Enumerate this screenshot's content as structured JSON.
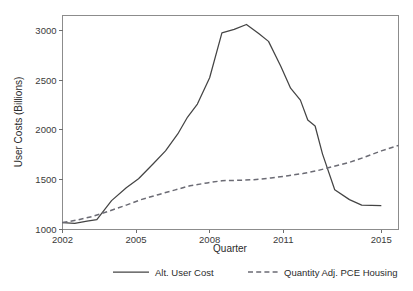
{
  "chart_data": {
    "type": "line",
    "title": "",
    "xlabel": "Quarter",
    "ylabel": "User Costs (Billions)",
    "xlim": [
      2002.0,
      2015.7
    ],
    "ylim": [
      1000,
      3150
    ],
    "grid": false,
    "legend_position": "bottom",
    "xticks": [
      "2002",
      "2005",
      "2008",
      "2011",
      "2015"
    ],
    "xtick_values": [
      2002,
      2005,
      2008,
      2011,
      2015
    ],
    "yticks": [
      "1000",
      "1500",
      "2000",
      "2500",
      "3000"
    ],
    "ytick_values": [
      1000,
      1500,
      2000,
      2500,
      3000
    ],
    "series": [
      {
        "name": "Alt. User Cost",
        "style": "solid",
        "color": "#444444",
        "x": [
          2002.0,
          2002.5,
          2003.0,
          2003.4,
          2004.0,
          2004.6,
          2005.1,
          2005.7,
          2006.2,
          2006.7,
          2007.1,
          2007.5,
          2008.0,
          2008.5,
          2009.0,
          2009.5,
          2010.0,
          2010.4,
          2010.9,
          2011.3,
          2011.7,
          2012.0,
          2012.3,
          2012.6,
          2013.1,
          2013.7,
          2014.2,
          2015.0
        ],
        "values": [
          1070,
          1062,
          1085,
          1100,
          1290,
          1420,
          1510,
          1660,
          1790,
          1960,
          2130,
          2260,
          2525,
          2975,
          3010,
          3060,
          2970,
          2890,
          2640,
          2420,
          2300,
          2100,
          2040,
          1760,
          1400,
          1300,
          1245,
          1240
        ]
      },
      {
        "name": "Quantity Adj. PCE Housing",
        "style": "dashed",
        "color": "#6b6b74",
        "x": [
          2002.0,
          2002.6,
          2003.2,
          2003.9,
          2004.6,
          2005.2,
          2005.9,
          2006.6,
          2007.2,
          2007.9,
          2008.5,
          2009.2,
          2009.8,
          2010.5,
          2011.2,
          2011.8,
          2012.4,
          2013.0,
          2013.7,
          2014.3,
          2015.0,
          2015.7
        ],
        "values": [
          1070,
          1095,
          1130,
          1185,
          1245,
          1300,
          1350,
          1398,
          1440,
          1468,
          1490,
          1495,
          1500,
          1518,
          1540,
          1562,
          1592,
          1630,
          1675,
          1725,
          1790,
          1845
        ]
      }
    ],
    "annotations": [],
    "crossover_note": "Series cross near 2012.3 at about 1520"
  },
  "legend": {
    "items": [
      {
        "label": "Alt. User Cost",
        "style": "solid"
      },
      {
        "label": "Quantity Adj. PCE Housing",
        "style": "dashed"
      }
    ]
  }
}
